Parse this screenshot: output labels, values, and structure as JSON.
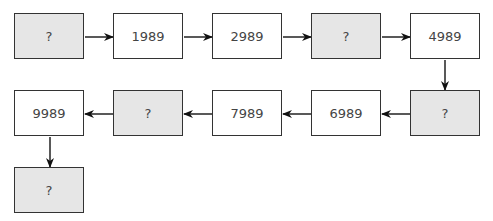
{
  "diagram": {
    "title": "",
    "nodes": [
      {
        "id": "n1",
        "label": "?",
        "unknown": true
      },
      {
        "id": "n2",
        "label": "1989",
        "unknown": false
      },
      {
        "id": "n3",
        "label": "2989",
        "unknown": false
      },
      {
        "id": "n4",
        "label": "?",
        "unknown": true
      },
      {
        "id": "n5",
        "label": "4989",
        "unknown": false
      },
      {
        "id": "n6",
        "label": "?",
        "unknown": true
      },
      {
        "id": "n7",
        "label": "6989",
        "unknown": false
      },
      {
        "id": "n8",
        "label": "7989",
        "unknown": false
      },
      {
        "id": "n9",
        "label": "?",
        "unknown": true
      },
      {
        "id": "n10",
        "label": "9989",
        "unknown": false
      },
      {
        "id": "n11",
        "label": "?",
        "unknown": true
      }
    ],
    "edges": [
      [
        "n1",
        "n2"
      ],
      [
        "n2",
        "n3"
      ],
      [
        "n3",
        "n4"
      ],
      [
        "n4",
        "n5"
      ],
      [
        "n5",
        "n6"
      ],
      [
        "n6",
        "n7"
      ],
      [
        "n7",
        "n8"
      ],
      [
        "n8",
        "n9"
      ],
      [
        "n9",
        "n10"
      ],
      [
        "n10",
        "n11"
      ]
    ],
    "colors": {
      "border": "#333333",
      "unknown_fill": "#e6e6e6",
      "known_fill": "#ffffff",
      "text": "#444444"
    }
  }
}
